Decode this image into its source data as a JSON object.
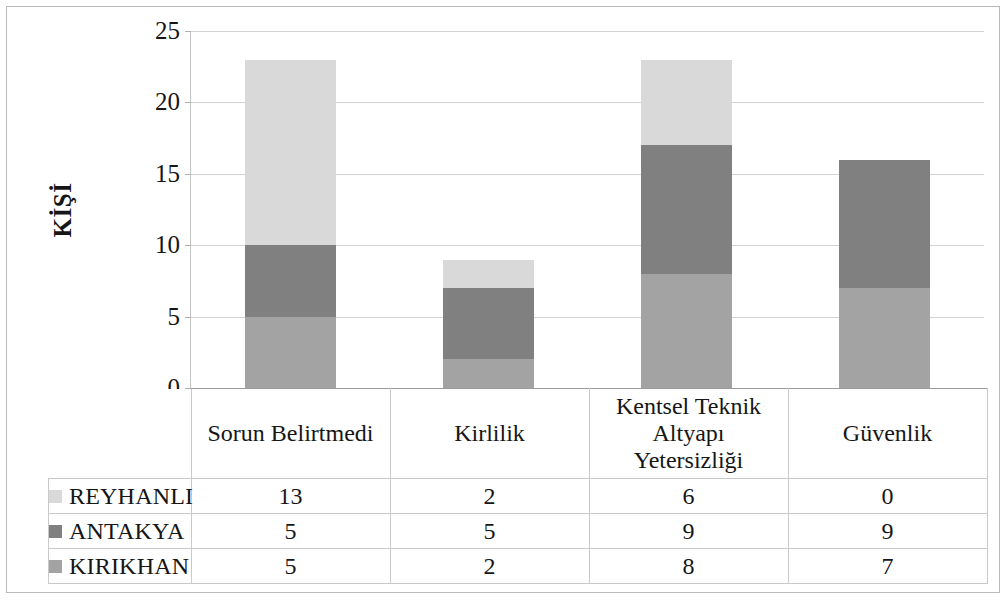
{
  "chart_data": {
    "type": "bar",
    "stacked": true,
    "title": "",
    "xlabel": "",
    "ylabel": "KİŞİ",
    "ylim": [
      0,
      25
    ],
    "ytick_step": 5,
    "yticks": [
      "0",
      "5",
      "10",
      "15",
      "20",
      "25"
    ],
    "grid": true,
    "legend_position": "table-row-headers",
    "categories": [
      "Sorun Belirtmedi",
      "Kirlilik",
      "Kentsel Teknik\nAltyapı\nYetersizliği",
      "Güvenlik"
    ],
    "series": [
      {
        "name": "REYHANLI",
        "values": [
          13,
          2,
          6,
          0
        ],
        "color": "#d9d9d9",
        "stack_order": 3
      },
      {
        "name": "ANTAKYA",
        "values": [
          5,
          5,
          9,
          9
        ],
        "color": "#808080",
        "stack_order": 2
      },
      {
        "name": "KIRIKHAN",
        "values": [
          5,
          2,
          8,
          7
        ],
        "color": "#a3a3a3",
        "stack_order": 1
      }
    ],
    "stack_totals": [
      23,
      9,
      23,
      16
    ]
  },
  "axis": {
    "y_title": "KİŞİ",
    "ticks": [
      {
        "label": "25",
        "value": 25
      },
      {
        "label": "20",
        "value": 20
      },
      {
        "label": "15",
        "value": 15
      },
      {
        "label": "10",
        "value": 10
      },
      {
        "label": "5",
        "value": 5
      },
      {
        "label": "0",
        "value": 0
      }
    ]
  },
  "category_headers": [
    {
      "lines": [
        "Sorun Belirtmedi"
      ]
    },
    {
      "lines": [
        "Kirlilik"
      ]
    },
    {
      "lines": [
        "Kentsel Teknik",
        "Altyapı",
        "Yetersizliği"
      ]
    },
    {
      "lines": [
        "Güvenlik"
      ]
    }
  ],
  "table": {
    "rows": [
      {
        "label": "REYHANLI",
        "color": "#d9d9d9",
        "values": [
          "13",
          "2",
          "6",
          "0"
        ]
      },
      {
        "label": "ANTAKYA",
        "color": "#808080",
        "values": [
          "5",
          "5",
          "9",
          "9"
        ]
      },
      {
        "label": "KIRIKHAN",
        "color": "#a3a3a3",
        "values": [
          "5",
          "2",
          "8",
          "7"
        ]
      }
    ]
  },
  "colors": {
    "reyhanli": "#d9d9d9",
    "antakya": "#808080",
    "kirikhan": "#a3a3a3",
    "gridline": "#d2d2d2",
    "border": "#c9c9c9",
    "frame": "#b9b9b9"
  }
}
